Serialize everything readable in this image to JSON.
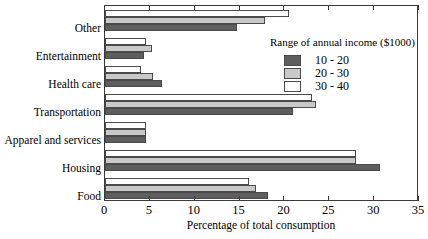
{
  "chart_data": {
    "type": "bar",
    "orientation": "horizontal",
    "title": "",
    "xlabel": "Percentage of total consumption",
    "ylabel": "",
    "xlim": [
      0,
      35
    ],
    "xticks": [
      0,
      5,
      10,
      15,
      20,
      25,
      30,
      35
    ],
    "xtick_labels": [
      "0",
      "5",
      "10",
      "15",
      "20",
      "25",
      "30",
      "35"
    ],
    "grid": false,
    "legend_title": "Range of annual income ($1000)",
    "legend_position": "upper right (inside plot)",
    "categories": [
      "Food",
      "Housing",
      "Apparel and services",
      "Transportation",
      "Health care",
      "Entertainment",
      "Other"
    ],
    "series": [
      {
        "name": "10 - 20",
        "color": "#5e5e5e",
        "values": [
          18.2,
          30.6,
          4.6,
          21.0,
          6.4,
          4.3,
          14.7
        ]
      },
      {
        "name": "20 - 30",
        "color": "#c9c9c9",
        "values": [
          16.8,
          28.0,
          4.6,
          23.5,
          5.3,
          5.2,
          17.8
        ]
      },
      {
        "name": "30 - 40",
        "color": "#ffffff",
        "values": [
          16.0,
          28.0,
          4.6,
          23.1,
          4.0,
          4.6,
          20.5
        ]
      }
    ]
  },
  "colors": {
    "axis": "#3b3b3b",
    "bar_outline": "#4a4a4a",
    "background": "#ffffff",
    "series_10_20": "#5e5e5e",
    "series_20_30": "#c9c9c9",
    "series_30_40": "#ffffff"
  }
}
